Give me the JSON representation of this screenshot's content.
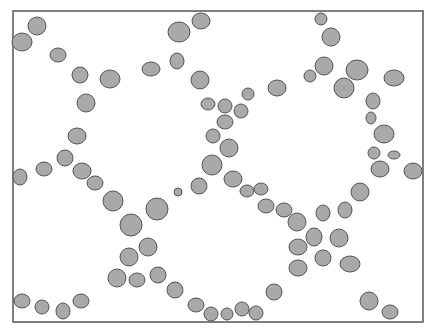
{
  "figure": {
    "frame": {
      "x": 13,
      "y": 11,
      "width": 410,
      "height": 311,
      "stroke": "#555555"
    },
    "particle_fill": "#a9a9a9",
    "particle_stroke": "#555555",
    "background": "#ffffff",
    "particles": [
      {
        "cx": 22,
        "cy": 42,
        "rx": 10,
        "ry": 9
      },
      {
        "cx": 37,
        "cy": 26,
        "rx": 9,
        "ry": 9
      },
      {
        "cx": 58,
        "cy": 55,
        "rx": 8,
        "ry": 7
      },
      {
        "cx": 80,
        "cy": 75,
        "rx": 8,
        "ry": 8
      },
      {
        "cx": 110,
        "cy": 79,
        "rx": 10,
        "ry": 9
      },
      {
        "cx": 86,
        "cy": 103,
        "rx": 9,
        "ry": 9
      },
      {
        "cx": 151,
        "cy": 69,
        "rx": 9,
        "ry": 7
      },
      {
        "cx": 177,
        "cy": 61,
        "rx": 7,
        "ry": 8
      },
      {
        "cx": 179,
        "cy": 32,
        "rx": 11,
        "ry": 10
      },
      {
        "cx": 201,
        "cy": 21,
        "rx": 9,
        "ry": 8
      },
      {
        "cx": 200,
        "cy": 80,
        "rx": 9,
        "ry": 9
      },
      {
        "cx": 77,
        "cy": 136,
        "rx": 9,
        "ry": 8
      },
      {
        "cx": 65,
        "cy": 158,
        "rx": 8,
        "ry": 8
      },
      {
        "cx": 44,
        "cy": 169,
        "rx": 8,
        "ry": 7
      },
      {
        "cx": 20,
        "cy": 177,
        "rx": 7,
        "ry": 8
      },
      {
        "cx": 82,
        "cy": 171,
        "rx": 9,
        "ry": 8
      },
      {
        "cx": 95,
        "cy": 183,
        "rx": 8,
        "ry": 7
      },
      {
        "cx": 113,
        "cy": 201,
        "rx": 10,
        "ry": 10
      },
      {
        "cx": 131,
        "cy": 225,
        "rx": 11,
        "ry": 11
      },
      {
        "cx": 157,
        "cy": 209,
        "rx": 11,
        "ry": 11
      },
      {
        "cx": 178,
        "cy": 192,
        "rx": 4,
        "ry": 4
      },
      {
        "cx": 199,
        "cy": 186,
        "rx": 8,
        "ry": 8
      },
      {
        "cx": 148,
        "cy": 247,
        "rx": 9,
        "ry": 9
      },
      {
        "cx": 129,
        "cy": 257,
        "rx": 9,
        "ry": 9
      },
      {
        "cx": 117,
        "cy": 278,
        "rx": 9,
        "ry": 9
      },
      {
        "cx": 137,
        "cy": 280,
        "rx": 8,
        "ry": 7
      },
      {
        "cx": 158,
        "cy": 275,
        "rx": 8,
        "ry": 8
      },
      {
        "cx": 175,
        "cy": 290,
        "rx": 8,
        "ry": 8
      },
      {
        "cx": 22,
        "cy": 301,
        "rx": 8,
        "ry": 7
      },
      {
        "cx": 42,
        "cy": 307,
        "rx": 7,
        "ry": 7
      },
      {
        "cx": 63,
        "cy": 311,
        "rx": 7,
        "ry": 8
      },
      {
        "cx": 81,
        "cy": 301,
        "rx": 8,
        "ry": 7
      },
      {
        "cx": 196,
        "cy": 305,
        "rx": 8,
        "ry": 7
      },
      {
        "cx": 211,
        "cy": 314,
        "rx": 7,
        "ry": 7
      },
      {
        "cx": 227,
        "cy": 314,
        "rx": 6,
        "ry": 6
      },
      {
        "cx": 242,
        "cy": 309,
        "rx": 7,
        "ry": 7
      },
      {
        "cx": 256,
        "cy": 313,
        "rx": 7,
        "ry": 7
      },
      {
        "cx": 274,
        "cy": 292,
        "rx": 8,
        "ry": 8
      },
      {
        "cx": 208,
        "cy": 104,
        "rx": 7,
        "ry": 6
      },
      {
        "cx": 225,
        "cy": 106,
        "rx": 7,
        "ry": 7
      },
      {
        "cx": 241,
        "cy": 111,
        "rx": 7,
        "ry": 7
      },
      {
        "cx": 225,
        "cy": 122,
        "rx": 8,
        "ry": 7
      },
      {
        "cx": 213,
        "cy": 136,
        "rx": 7,
        "ry": 7
      },
      {
        "cx": 229,
        "cy": 148,
        "rx": 9,
        "ry": 9
      },
      {
        "cx": 212,
        "cy": 165,
        "rx": 10,
        "ry": 10
      },
      {
        "cx": 233,
        "cy": 179,
        "rx": 9,
        "ry": 8
      },
      {
        "cx": 247,
        "cy": 191,
        "rx": 7,
        "ry": 6
      },
      {
        "cx": 261,
        "cy": 189,
        "rx": 7,
        "ry": 6
      },
      {
        "cx": 266,
        "cy": 206,
        "rx": 8,
        "ry": 7
      },
      {
        "cx": 284,
        "cy": 210,
        "rx": 8,
        "ry": 7
      },
      {
        "cx": 297,
        "cy": 222,
        "rx": 9,
        "ry": 9
      },
      {
        "cx": 314,
        "cy": 237,
        "rx": 8,
        "ry": 9
      },
      {
        "cx": 298,
        "cy": 247,
        "rx": 9,
        "ry": 8
      },
      {
        "cx": 298,
        "cy": 268,
        "rx": 9,
        "ry": 8
      },
      {
        "cx": 323,
        "cy": 258,
        "rx": 8,
        "ry": 8
      },
      {
        "cx": 339,
        "cy": 238,
        "rx": 9,
        "ry": 9
      },
      {
        "cx": 350,
        "cy": 264,
        "rx": 10,
        "ry": 8
      },
      {
        "cx": 323,
        "cy": 213,
        "rx": 7,
        "ry": 8
      },
      {
        "cx": 345,
        "cy": 210,
        "rx": 7,
        "ry": 8
      },
      {
        "cx": 360,
        "cy": 192,
        "rx": 9,
        "ry": 9
      },
      {
        "cx": 369,
        "cy": 301,
        "rx": 9,
        "ry": 9
      },
      {
        "cx": 390,
        "cy": 312,
        "rx": 8,
        "ry": 7
      },
      {
        "cx": 248,
        "cy": 94,
        "rx": 6,
        "ry": 6
      },
      {
        "cx": 277,
        "cy": 88,
        "rx": 9,
        "ry": 8
      },
      {
        "cx": 321,
        "cy": 19,
        "rx": 6,
        "ry": 6
      },
      {
        "cx": 331,
        "cy": 37,
        "rx": 9,
        "ry": 9
      },
      {
        "cx": 310,
        "cy": 76,
        "rx": 6,
        "ry": 6
      },
      {
        "cx": 324,
        "cy": 66,
        "rx": 9,
        "ry": 9
      },
      {
        "cx": 357,
        "cy": 70,
        "rx": 11,
        "ry": 10
      },
      {
        "cx": 344,
        "cy": 88,
        "rx": 10,
        "ry": 10
      },
      {
        "cx": 394,
        "cy": 78,
        "rx": 10,
        "ry": 8
      },
      {
        "cx": 373,
        "cy": 101,
        "rx": 7,
        "ry": 8
      },
      {
        "cx": 371,
        "cy": 118,
        "rx": 5,
        "ry": 6
      },
      {
        "cx": 384,
        "cy": 134,
        "rx": 10,
        "ry": 9
      },
      {
        "cx": 374,
        "cy": 153,
        "rx": 6,
        "ry": 6
      },
      {
        "cx": 394,
        "cy": 155,
        "rx": 6,
        "ry": 4
      },
      {
        "cx": 380,
        "cy": 169,
        "rx": 9,
        "ry": 8
      },
      {
        "cx": 413,
        "cy": 171,
        "rx": 9,
        "ry": 8
      }
    ]
  }
}
